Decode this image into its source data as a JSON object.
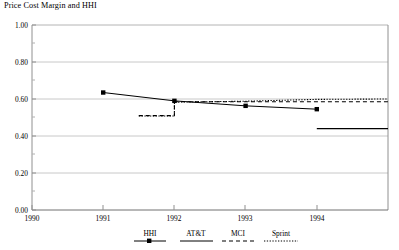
{
  "chart_data": {
    "type": "line",
    "title": "Price Cost Margin and HHI",
    "xlabel": "",
    "ylabel": "",
    "xlim": [
      1990,
      1995
    ],
    "ylim": [
      0.0,
      1.0
    ],
    "grid": true,
    "legend_position": "bottom",
    "x_ticks": [
      "1990",
      "1991",
      "1992",
      "1993",
      "1994"
    ],
    "x_tick_values": [
      1990,
      1991,
      1992,
      1993,
      1994
    ],
    "y_ticks": [
      "0.00",
      "0.20",
      "0.40",
      "0.60",
      "0.80",
      "1.00"
    ],
    "y_tick_values": [
      0.0,
      0.2,
      0.4,
      0.6,
      0.8,
      1.0
    ],
    "series": [
      {
        "name": "HHI",
        "style": "solid-marker",
        "marker": "square",
        "x": [
          1991,
          1992,
          1993,
          1994
        ],
        "values": [
          0.635,
          0.59,
          0.563,
          0.545
        ]
      },
      {
        "name": "AT&T",
        "style": "solid",
        "marker": "none",
        "x": [
          1994,
          1995
        ],
        "values": [
          0.44,
          0.44
        ]
      },
      {
        "name": "MCI",
        "style": "dashed",
        "marker": "none",
        "x": [
          1991.5,
          1992,
          1992,
          1993,
          1994,
          1995
        ],
        "values": [
          0.51,
          0.51,
          0.585,
          0.585,
          0.585,
          0.585
        ]
      },
      {
        "name": "Sprint",
        "style": "dotted",
        "marker": "none",
        "x": [
          1991.5,
          1992,
          1992,
          1993,
          1994,
          1995
        ],
        "values": [
          0.508,
          0.508,
          0.583,
          0.588,
          0.598,
          0.6
        ]
      }
    ]
  },
  "legend": {
    "items": [
      {
        "label": "HHI",
        "style": "solid-marker"
      },
      {
        "label": "AT&T",
        "style": "solid"
      },
      {
        "label": "MCI",
        "style": "dashed"
      },
      {
        "label": "Sprint",
        "style": "dotted"
      }
    ]
  },
  "colors": {
    "line": "#000000",
    "grid": "#c8c8c8",
    "axis": "#808080",
    "background": "#ffffff"
  }
}
